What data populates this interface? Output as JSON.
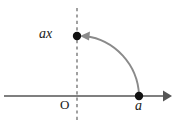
{
  "figure": {
    "title": "",
    "background_color": "#ffffff",
    "labels": {
      "point_ax": "ax",
      "origin": "O",
      "point_a": "a"
    },
    "colors": {
      "axis": "#555555",
      "point": "#111111",
      "arc": "#8a8a8a",
      "dashed_line": "#6f6f6f",
      "text": "#1a1a1a"
    },
    "geometry": {
      "origin_x": 77,
      "origin_y": 96,
      "axis_start_x": 4,
      "axis_end_x": 170,
      "point_a_x": 139,
      "point_a_y": 96,
      "point_ax_x": 77,
      "point_ax_y": 36,
      "arc_radius": 61,
      "dashed_line_top_y": 8,
      "dashed_line_bottom_y": 120
    },
    "elements": {
      "axis_name": "horizontal-axis",
      "dashed_name": "vertical-dashed-line",
      "arc_name": "rotation-arc",
      "arrow_name": "rotation-arrowhead"
    }
  }
}
